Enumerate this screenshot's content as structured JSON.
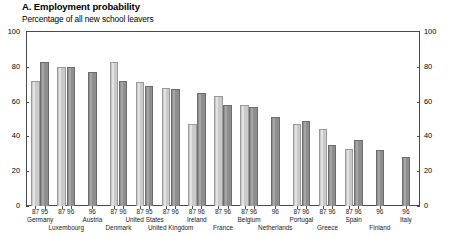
{
  "header": {
    "title": "A. Employment probability",
    "subtitle": "Percentage of all new school leavers"
  },
  "axis": {
    "y_ticks": [
      "0",
      "20",
      "40",
      "60",
      "80",
      "100"
    ],
    "y_min": 0,
    "y_max": 100
  },
  "chart_data": {
    "type": "bar",
    "title": "A. Employment probability",
    "subtitle": "Percentage of all new school leavers",
    "xlabel": "",
    "ylabel": "",
    "ylim": [
      0,
      100
    ],
    "yticks": [
      0,
      20,
      40,
      60,
      80,
      100
    ],
    "grid": false,
    "legend": "none",
    "categories": [
      "Germany",
      "Luxembourg",
      "Austria",
      "Denmark",
      "United States",
      "United Kingdom",
      "Ireland",
      "France",
      "Belgium",
      "Netherlands",
      "Portugal",
      "Greece",
      "Spain",
      "Finland",
      "Italy"
    ],
    "series": [
      {
        "name": "87",
        "color": "#cacaca",
        "values": [
          72,
          80,
          null,
          83,
          71,
          68,
          47,
          63,
          58,
          null,
          47,
          44,
          33,
          null,
          null
        ]
      },
      {
        "name": "95/96",
        "color": "#8e8e8e",
        "values": [
          83,
          80,
          77,
          72,
          69,
          67,
          65,
          58,
          57,
          51,
          49,
          35,
          38,
          32,
          28
        ]
      }
    ],
    "groups": [
      {
        "country": "Germany",
        "row": 1,
        "years": [
          "87",
          "95"
        ],
        "values": [
          72,
          83
        ]
      },
      {
        "country": "Luxembourg",
        "row": 2,
        "years": [
          "87",
          "96"
        ],
        "values": [
          80,
          80
        ]
      },
      {
        "country": "Austria",
        "row": 1,
        "years": [
          "96"
        ],
        "values": [
          77
        ]
      },
      {
        "country": "Denmark",
        "row": 2,
        "years": [
          "87",
          "96"
        ],
        "values": [
          83,
          72
        ]
      },
      {
        "country": "United States",
        "row": 1,
        "years": [
          "87",
          "95"
        ],
        "values": [
          71,
          69
        ]
      },
      {
        "country": "United Kingdom",
        "row": 2,
        "years": [
          "87",
          "96"
        ],
        "values": [
          68,
          67
        ]
      },
      {
        "country": "Ireland",
        "row": 1,
        "years": [
          "87",
          "96"
        ],
        "values": [
          47,
          65
        ]
      },
      {
        "country": "France",
        "row": 2,
        "years": [
          "87",
          "96"
        ],
        "values": [
          63,
          58
        ]
      },
      {
        "country": "Belgium",
        "row": 1,
        "years": [
          "87",
          "96"
        ],
        "values": [
          58,
          57
        ]
      },
      {
        "country": "Netherlands",
        "row": 2,
        "years": [
          "96"
        ],
        "values": [
          51
        ]
      },
      {
        "country": "Portugal",
        "row": 1,
        "years": [
          "87",
          "96"
        ],
        "values": [
          47,
          49
        ]
      },
      {
        "country": "Greece",
        "row": 2,
        "years": [
          "87",
          "96"
        ],
        "values": [
          44,
          35
        ]
      },
      {
        "country": "Spain",
        "row": 1,
        "years": [
          "87",
          "96"
        ],
        "values": [
          33,
          38
        ]
      },
      {
        "country": "Finland",
        "row": 2,
        "years": [
          "96"
        ],
        "values": [
          32
        ]
      },
      {
        "country": "Italy",
        "row": 1,
        "years": [
          "96"
        ],
        "values": [
          28
        ]
      }
    ]
  },
  "colors": {
    "bar_light": "#cacaca",
    "bar_dark": "#8e8e8e",
    "axis": "#4a4a4a",
    "text": "#000000"
  }
}
